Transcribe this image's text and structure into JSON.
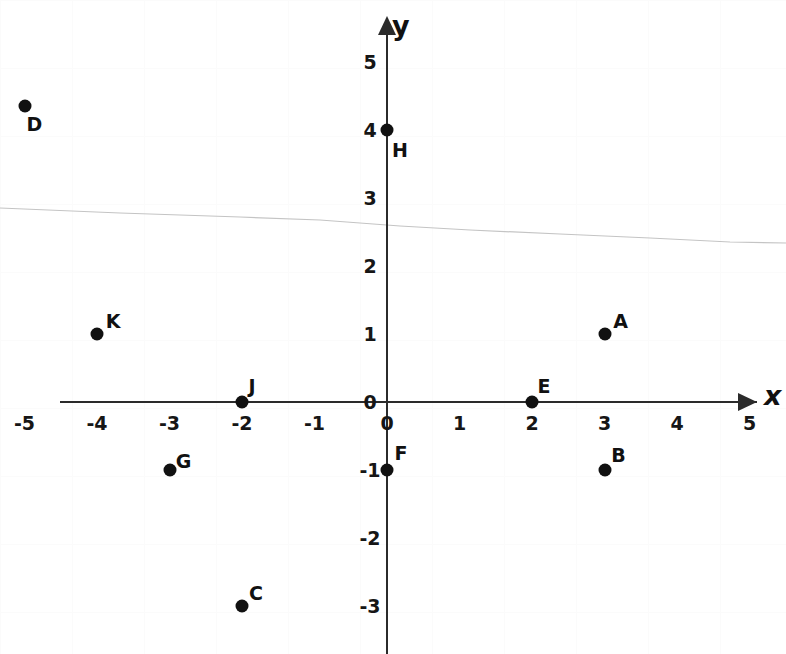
{
  "chart_data": {
    "type": "scatter",
    "title": "",
    "xlabel": "x",
    "ylabel": "y",
    "xlim": [
      -5,
      5
    ],
    "ylim": [
      -3,
      5
    ],
    "grid": false,
    "legend": "none",
    "x_ticks": [
      "-5",
      "-4",
      "-3",
      "-2",
      "-1",
      "0",
      "1",
      "2",
      "3",
      "4",
      "5"
    ],
    "x_tick_values": [
      -5,
      -4,
      -3,
      -2,
      -1,
      0,
      1,
      2,
      3,
      4,
      5
    ],
    "y_ticks": [
      "5",
      "4",
      "3",
      "2",
      "1",
      "0",
      "-1",
      "-2",
      "-3"
    ],
    "y_tick_values": [
      5,
      4,
      3,
      2,
      1,
      0,
      -1,
      -2,
      -3
    ],
    "points": [
      {
        "name": "D",
        "x": -5,
        "y": 4.35,
        "label_dx": 10,
        "label_dy": 18
      },
      {
        "name": "H",
        "x": 0,
        "y": 4,
        "label_dx": 13,
        "label_dy": 20
      },
      {
        "name": "K",
        "x": -4,
        "y": 1,
        "label_dx": 16,
        "label_dy": -13
      },
      {
        "name": "A",
        "x": 3,
        "y": 1,
        "label_dx": 16,
        "label_dy": -13
      },
      {
        "name": "J",
        "x": -2,
        "y": 0,
        "label_dx": 10,
        "label_dy": -16
      },
      {
        "name": "E",
        "x": 2,
        "y": 0,
        "label_dx": 12,
        "label_dy": -16
      },
      {
        "name": "F",
        "x": 0,
        "y": -1,
        "label_dx": 14,
        "label_dy": -17
      },
      {
        "name": "G",
        "x": -3,
        "y": -1,
        "label_dx": 14,
        "label_dy": -9
      },
      {
        "name": "B",
        "x": 3,
        "y": -1,
        "label_dx": 14,
        "label_dy": -15
      },
      {
        "name": "C",
        "x": -2,
        "y": -3,
        "label_dx": 14,
        "label_dy": -13
      }
    ]
  },
  "axes": {
    "x_axis_name": "x",
    "y_axis_name": "y",
    "origin_label": "0"
  },
  "colors": {
    "axis": "#2b2b2b",
    "point": "#111111",
    "text": "#161616",
    "background": "#ffffff",
    "crease": "#c9c9c9"
  }
}
